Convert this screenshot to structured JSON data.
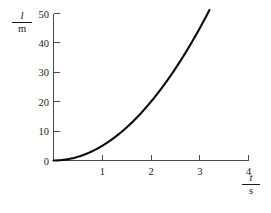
{
  "chart_data": {
    "type": "line",
    "title": "",
    "subtitle": "",
    "xlabel": "t/s",
    "ylabel": "l/m",
    "xlabel_numerator": "t",
    "xlabel_denominator": "s",
    "ylabel_numerator": "l",
    "ylabel_denominator": "m",
    "xlim": [
      0,
      4
    ],
    "ylim": [
      0,
      50
    ],
    "xticks": [
      1,
      2,
      3,
      4
    ],
    "xtick_labels": [
      "1",
      "2",
      "3",
      "4"
    ],
    "yticks": [
      0,
      10,
      20,
      30,
      40,
      50
    ],
    "ytick_labels": [
      "0",
      "10",
      "20",
      "30",
      "40",
      "50"
    ],
    "origin_label": "0",
    "grid": false,
    "legend": false,
    "legend_position": "none",
    "series": [
      {
        "name": "distance fallen",
        "relation": "l = 5 t^2",
        "color": "#0a0a0a",
        "x": [
          0.0,
          0.2,
          0.4,
          0.6,
          0.8,
          1.0,
          1.2,
          1.4,
          1.6,
          1.8,
          2.0,
          2.2,
          2.4,
          2.6,
          2.8,
          3.0,
          3.2
        ],
        "y": [
          0.0,
          0.2,
          0.8,
          1.8,
          3.2,
          5.0,
          7.2,
          9.8,
          12.8,
          16.2,
          20.0,
          24.2,
          28.8,
          33.8,
          39.2,
          45.0,
          51.2
        ]
      }
    ],
    "annotations": []
  },
  "axes": {
    "y_axis_name": "vertical-axis",
    "x_axis_name": "horizontal-axis"
  }
}
